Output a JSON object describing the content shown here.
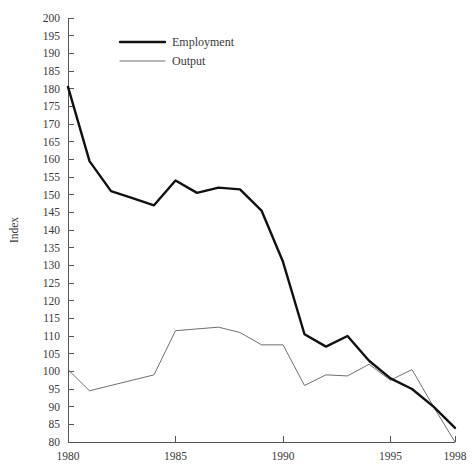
{
  "chart_data": {
    "type": "line",
    "title": "",
    "xlabel": "",
    "ylabel": "Index",
    "xlim": [
      1980,
      1998
    ],
    "ylim": [
      80,
      200
    ],
    "grid": false,
    "legend_position": "top-left-inside",
    "x": [
      1980,
      1981,
      1982,
      1983,
      1984,
      1985,
      1986,
      1987,
      1988,
      1989,
      1990,
      1991,
      1992,
      1993,
      1994,
      1995,
      1996,
      1997,
      1998
    ],
    "series": [
      {
        "name": "Employment",
        "color": "#111111",
        "line_width": 2.4,
        "values": [
          180.5,
          159.5,
          151.0,
          149.0,
          147.0,
          154.0,
          150.5,
          152.0,
          151.5,
          145.5,
          131.0,
          110.5,
          107.0,
          110.0,
          103.0,
          98.0,
          95.0,
          90.0,
          84.0
        ]
      },
      {
        "name": "Output",
        "color": "#6f6f6f",
        "line_width": 1.0,
        "values": [
          100.5,
          94.5,
          96.0,
          97.5,
          99.0,
          111.5,
          112.0,
          112.5,
          111.0,
          107.5,
          107.5,
          96.0,
          99.0,
          98.7,
          102.0,
          97.5,
          100.5,
          90.0,
          80.0
        ]
      }
    ],
    "y_ticks": [
      80,
      85,
      90,
      95,
      100,
      105,
      110,
      115,
      120,
      125,
      130,
      135,
      140,
      145,
      150,
      155,
      160,
      165,
      170,
      175,
      180,
      185,
      190,
      195,
      200
    ],
    "y_tick_labels": [
      "80",
      "85",
      "90",
      "95",
      "100",
      "105",
      "110",
      "115",
      "120",
      "125",
      "130",
      "135",
      "140",
      "145",
      "150",
      "155",
      "160",
      "165",
      "170",
      "175",
      "180",
      "185",
      "190",
      "195",
      "200"
    ],
    "x_ticks": [
      1980,
      1985,
      1990,
      1995,
      1998
    ],
    "x_tick_labels": [
      "1980",
      "1985",
      "1990",
      "1995",
      "1998"
    ]
  },
  "legend": {
    "entries": [
      {
        "label": "Employment"
      },
      {
        "label": "Output"
      }
    ]
  },
  "axes": {
    "y_title": "Index"
  }
}
